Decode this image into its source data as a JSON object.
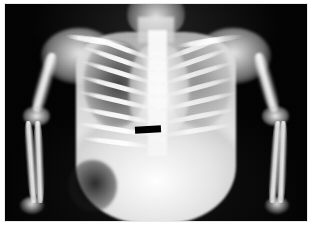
{
  "image": {
    "kind": "radiograph",
    "modality": "X-ray",
    "projection": "anteroposterior",
    "region": "chest and abdomen",
    "subject": "infant",
    "colorspace": "grayscale",
    "width_px": 312,
    "height_px": 237,
    "frame_color": "#e9e9e9",
    "film_background_color": "#050505",
    "page_background_color": "#ffffff",
    "alt_text": "Black and white anteroposterior chest and abdomen radiograph of an infant with arms abducted, a black rectangular anonymization bar over the mid chest, framed by a thin light border."
  },
  "overlays": {
    "censor_bar": {
      "name": "anonymization bar",
      "color": "#000000",
      "shape": "rectangle",
      "rotation_deg": -3
    }
  },
  "anatomy": {
    "head": "skull and facial soft tissue, partially cut at top edge",
    "neck": "cervical soft tissue column",
    "shoulders": [
      "left shoulder girdle",
      "right shoulder girdle"
    ],
    "clavicles": [
      "left clavicle",
      "right clavicle"
    ],
    "spine": "thoracolumbar spine",
    "mediastinum": "cardiomediastinal silhouette",
    "lungs": [
      {
        "side": "left",
        "appearance": "radiolucent, dark with visible rib interspaces"
      },
      {
        "side": "right",
        "appearance": "hazy, increased opacity"
      }
    ],
    "ribs": {
      "left_count": 8,
      "right_count": 7
    },
    "abdomen": "diffusely opaque soft tissue, distended",
    "bowel_gas": "dark gas shadow at left lower flank",
    "upper_limbs": [
      {
        "side": "left",
        "bones": [
          "humerus",
          "elbow",
          "radius",
          "ulna",
          "wrist",
          "hand"
        ]
      },
      {
        "side": "right",
        "bones": [
          "humerus",
          "elbow",
          "radius",
          "ulna",
          "wrist",
          "hand"
        ]
      }
    ]
  },
  "ribs_left": [
    {
      "top": 19.0,
      "left": 26.0,
      "width": 24.0,
      "rotate": 20
    },
    {
      "top": 24.5,
      "left": 25.0,
      "width": 25.0,
      "rotate": 19
    },
    {
      "top": 30.5,
      "left": 24.5,
      "width": 26.0,
      "rotate": 17
    },
    {
      "top": 37.0,
      "left": 24.0,
      "width": 26.5,
      "rotate": 15
    },
    {
      "top": 43.5,
      "left": 23.5,
      "width": 27.0,
      "rotate": 13
    },
    {
      "top": 50.0,
      "left": 23.5,
      "width": 27.0,
      "rotate": 11
    },
    {
      "top": 56.5,
      "left": 24.0,
      "width": 26.0,
      "rotate": 9
    },
    {
      "top": 62.5,
      "left": 25.0,
      "width": 24.0,
      "rotate": 7
    }
  ],
  "ribs_right": [
    {
      "top": 19.5,
      "left": 51.0,
      "width": 23.0,
      "rotate": -20
    },
    {
      "top": 25.0,
      "left": 51.0,
      "width": 24.0,
      "rotate": -19
    },
    {
      "top": 31.0,
      "left": 51.0,
      "width": 25.0,
      "rotate": -17
    },
    {
      "top": 37.5,
      "left": 51.0,
      "width": 25.5,
      "rotate": -15
    },
    {
      "top": 44.0,
      "left": 51.0,
      "width": 26.0,
      "rotate": -13
    },
    {
      "top": 50.5,
      "left": 51.0,
      "width": 25.5,
      "rotate": -11
    },
    {
      "top": 57.0,
      "left": 51.0,
      "width": 24.5,
      "rotate": -9
    }
  ]
}
